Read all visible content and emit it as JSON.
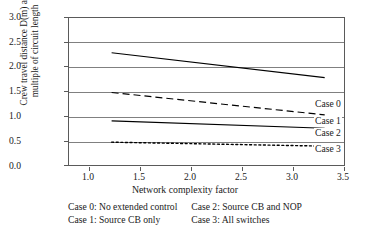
{
  "chart_data": {
    "type": "line",
    "title": "",
    "xlabel": "Network complexity factor",
    "ylabel_line1": "Crew travel distance D(m) as",
    "ylabel_line2": "multiple of circuit length",
    "xlim": [
      0.5,
      3.75
    ],
    "ylim": [
      0.0,
      3.0
    ],
    "xticks": [
      "1.0",
      "1.5",
      "2.0",
      "2.5",
      "3.0",
      "3.5"
    ],
    "xtick_values": [
      1.0,
      1.5,
      2.0,
      2.5,
      3.0,
      3.5
    ],
    "yticks": [
      "0.0",
      "0.5",
      "1.0",
      "1.5",
      "2.0",
      "2.5",
      "3.0"
    ],
    "ytick_values": [
      0.0,
      0.5,
      1.0,
      1.5,
      2.0,
      2.5,
      3.0
    ],
    "grid": "horizontal",
    "legend_position": "right-of-line-ends",
    "x": [
      1.0,
      3.5
    ],
    "series": [
      {
        "name": "Case 0",
        "style": "solid",
        "color": "#000000",
        "values": [
          2.3,
          1.8
        ]
      },
      {
        "name": "Case 1",
        "style": "dashed",
        "color": "#000000",
        "values": [
          1.5,
          1.05
        ]
      },
      {
        "name": "Case 2",
        "style": "solid",
        "color": "#000000",
        "values": [
          0.93,
          0.78
        ]
      },
      {
        "name": "Case 3",
        "style": "dotted",
        "color": "#000000",
        "values": [
          0.5,
          0.42
        ]
      }
    ]
  },
  "axis": {
    "y_title_line1": "Crew travel distance D(m) as",
    "y_title_line2": "multiple of circuit length",
    "x_title": "Network complexity factor",
    "y_tick_0": "0.0",
    "y_tick_1": "0.5",
    "y_tick_2": "1.0",
    "y_tick_3": "1.5",
    "y_tick_4": "2.0",
    "y_tick_5": "2.5",
    "y_tick_6": "3.0",
    "x_tick_0": "1.0",
    "x_tick_1": "1.5",
    "x_tick_2": "2.0",
    "x_tick_3": "2.5",
    "x_tick_4": "3.0",
    "x_tick_5": "3.5"
  },
  "series_labels": {
    "case0": "Case 0",
    "case1": "Case 1",
    "case2": "Case 2",
    "case3": "Case 3"
  },
  "legend": {
    "rows": [
      {
        "left": "Case 0: No extended control",
        "right": "Case 2: Source CB and NOP"
      },
      {
        "left": "Case 1: Source CB only",
        "right": "Case 3: All switches"
      }
    ],
    "r0_left": "Case 0: No extended control",
    "r0_right": "Case 2: Source CB and NOP",
    "r1_left": "Case 1: Source CB only",
    "r1_right": "Case 3: All switches"
  },
  "colors": {
    "line": "#000000",
    "grid": "#808080",
    "frame": "#5a5a5a",
    "text": "#1a1a1a",
    "background": "#ffffff"
  }
}
